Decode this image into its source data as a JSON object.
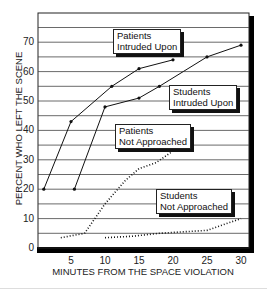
{
  "chart_data": {
    "type": "line",
    "title": "",
    "xlabel": "MINUTES FROM THE SPACE VIOLATION",
    "ylabel": "PERCENT WHO LEFT THE SCENE",
    "xlim": [
      0,
      31
    ],
    "ylim": [
      0,
      80
    ],
    "x_ticks": [
      5,
      10,
      15,
      20,
      25,
      30
    ],
    "y_ticks": [
      0,
      10,
      20,
      30,
      40,
      50,
      60,
      70
    ],
    "grid": {
      "horizontal": true,
      "step": 5
    },
    "legend": "inline callouts",
    "series": [
      {
        "name": "Patients Intruded Upon",
        "style": "solid-markers",
        "x": [
          1,
          5,
          11,
          15,
          20
        ],
        "y": [
          20,
          43,
          55,
          61,
          64
        ]
      },
      {
        "name": "Students Intruded Upon",
        "style": "solid-markers",
        "x": [
          5.5,
          10,
          15,
          18,
          25,
          30
        ],
        "y": [
          20,
          48,
          51,
          55,
          65,
          69
        ]
      },
      {
        "name": "Patients Not Approached",
        "style": "dotted",
        "x": [
          3.5,
          7,
          10,
          13,
          15,
          17.5,
          20
        ],
        "y": [
          3.5,
          5,
          15,
          23,
          27,
          29,
          33
        ]
      },
      {
        "name": "Students Not Approached",
        "style": "dotted",
        "x": [
          10,
          14,
          18,
          25,
          30
        ],
        "y": [
          3.5,
          4,
          5,
          6,
          10
        ]
      }
    ]
  },
  "labels": {
    "ylabel": "PERCENT WHO LEFT THE SCENE",
    "xlabel": "MINUTES FROM THE SPACE VIOLATION",
    "callouts": {
      "patients_intruded": [
        "Patients",
        "Intruded Upon"
      ],
      "students_intruded": [
        "Students",
        "Intruded Upon"
      ],
      "patients_not": [
        "Patients",
        "Not Approached"
      ],
      "students_not": [
        "Students",
        "Not Approached"
      ]
    }
  },
  "colors": {
    "line": "#111111",
    "grid": "#444444",
    "frame": "#000000"
  }
}
